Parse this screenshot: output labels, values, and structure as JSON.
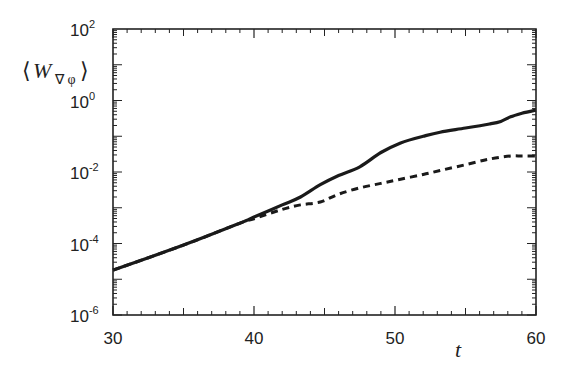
{
  "chart_data": {
    "type": "line",
    "title": "",
    "xlabel": "t",
    "ylabel": "⟨W∇φ⟩",
    "ylabel_main": "W",
    "ylabel_sub": "∇ φ",
    "yscale": "log",
    "xlim": [
      30,
      60
    ],
    "ylim": [
      1e-06,
      100
    ],
    "grid": false,
    "legend": null,
    "x_ticks": [
      30,
      40,
      50,
      60
    ],
    "x_tick_labels": [
      "30",
      "40",
      "50",
      "60"
    ],
    "y_ticks": [
      1e-06,
      0.0001,
      0.01,
      1,
      100
    ],
    "y_tick_labels": [
      {
        "base": "10",
        "exp": "-6"
      },
      {
        "base": "10",
        "exp": "-4"
      },
      {
        "base": "10",
        "exp": "-2"
      },
      {
        "base": "10",
        "exp": "0"
      },
      {
        "base": "10",
        "exp": "2"
      }
    ],
    "series": [
      {
        "name": "solid",
        "style": "solid",
        "color": "#1a1a1a",
        "x": [
          30,
          35,
          39,
          40,
          42,
          43.3,
          44.7,
          46,
          47.5,
          49,
          50.4,
          52,
          53.2,
          55,
          56.7,
          57.5,
          58.2,
          59,
          60
        ],
        "y": [
          1.8e-05,
          9e-05,
          0.00037,
          0.00055,
          0.0012,
          0.002,
          0.0044,
          0.008,
          0.014,
          0.035,
          0.065,
          0.1,
          0.13,
          0.17,
          0.22,
          0.26,
          0.35,
          0.44,
          0.54
        ]
      },
      {
        "name": "dashed",
        "style": "dashed",
        "color": "#1a1a1a",
        "x": [
          30,
          35,
          39,
          40,
          42,
          43.3,
          44.7,
          46,
          47.5,
          49,
          50.4,
          52,
          53.2,
          55,
          56.7,
          58.2,
          59,
          60
        ],
        "y": [
          1.8e-05,
          9e-05,
          0.00037,
          0.00049,
          0.0009,
          0.0012,
          0.00145,
          0.0024,
          0.0036,
          0.0048,
          0.0063,
          0.0085,
          0.011,
          0.016,
          0.023,
          0.028,
          0.028,
          0.028
        ]
      }
    ]
  }
}
